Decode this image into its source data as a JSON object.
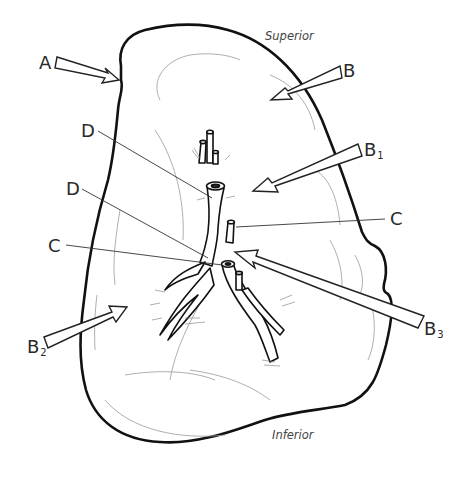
{
  "diagram": {
    "type": "anatomical-line-drawing",
    "orientation": {
      "superior": "Superior",
      "inferior": "Inferior"
    },
    "labels": [
      {
        "id": "A",
        "text": "A",
        "sub": ""
      },
      {
        "id": "B",
        "text": "B",
        "sub": ""
      },
      {
        "id": "B1",
        "text": "B",
        "sub": "1"
      },
      {
        "id": "B2",
        "text": "B",
        "sub": "2"
      },
      {
        "id": "B3",
        "text": "B",
        "sub": "3"
      },
      {
        "id": "C_upper",
        "text": "C",
        "sub": ""
      },
      {
        "id": "C_lower",
        "text": "C",
        "sub": ""
      },
      {
        "id": "D_upper",
        "text": "D",
        "sub": ""
      },
      {
        "id": "D_lower",
        "text": "D",
        "sub": ""
      }
    ],
    "colors": {
      "outline": "#111111",
      "detail": "#888888",
      "leader": "#333333",
      "background": "#ffffff"
    }
  }
}
